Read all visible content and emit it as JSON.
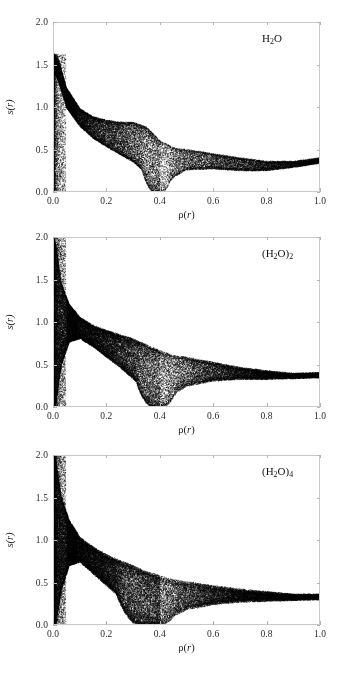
{
  "figure": {
    "width": 344,
    "height": 680,
    "background": "#ffffff",
    "axis_color": "#c9c9c9",
    "point_color": "#000000"
  },
  "axes": {
    "x_title_prefix": "ρ(",
    "x_title_var": "r",
    "x_title_suffix": ")",
    "y_title_prefix": "s(",
    "y_title_var": "r",
    "y_title_suffix": ")",
    "x_ticks": [
      0.0,
      0.2,
      0.4,
      0.6,
      0.8,
      1.0
    ],
    "x_tick_labels": [
      "0.0",
      "0.2",
      "0.4",
      "0.6",
      "0.8",
      "1.0"
    ],
    "y_ticks": [
      0.0,
      0.5,
      1.0,
      1.5,
      2.0
    ],
    "y_tick_labels": [
      "0.0",
      "0.5",
      "1.0",
      "1.5",
      "2.0"
    ],
    "xlim": [
      0.0,
      1.0
    ],
    "ylim": [
      0.0,
      2.0
    ],
    "grid": false
  },
  "chart_data": {
    "type": "scatter",
    "title": "",
    "xlabel": "ρ(r)",
    "ylabel": "s(r)",
    "xlim": [
      0.0,
      1.0
    ],
    "ylim": [
      0.0,
      2.0
    ],
    "x_ticks": [
      0.0,
      0.2,
      0.4,
      0.6,
      0.8,
      1.0
    ],
    "y_ticks": [
      0.0,
      0.5,
      1.0,
      1.5,
      2.0
    ],
    "grid": false,
    "legend": "none",
    "panels": [
      {
        "id": "monomer",
        "label_prefix": "H",
        "label_sub": "2",
        "label_suffix": "O",
        "label_plain": "H2O",
        "n_points": 42000,
        "spread": 0.055,
        "cusp_x": 0.385,
        "cusp_width": 0.055,
        "peak_s": 1.63,
        "peak_x": 0.018,
        "tail_min_s": 0.275,
        "tail_min_x": 0.76,
        "tail_end_s": 0.385,
        "bump_x": 0.3,
        "bump_amp": 0.1,
        "jitter": 0.01,
        "edge_darkness": 0.85,
        "series": {
          "envelope_x": [
            0.0,
            0.02,
            0.05,
            0.1,
            0.15,
            0.2,
            0.25,
            0.3,
            0.35,
            0.4,
            0.45,
            0.5,
            0.6,
            0.7,
            0.8,
            0.9,
            1.0
          ],
          "envelope_top": [
            1.63,
            1.55,
            1.22,
            0.98,
            0.88,
            0.82,
            0.78,
            0.76,
            0.72,
            0.58,
            0.52,
            0.5,
            0.45,
            0.4,
            0.36,
            0.36,
            0.4
          ],
          "envelope_bot": [
            1.45,
            1.3,
            1.0,
            0.78,
            0.64,
            0.54,
            0.45,
            0.36,
            0.22,
            0.0,
            0.18,
            0.27,
            0.28,
            0.26,
            0.26,
            0.3,
            0.35
          ]
        }
      },
      {
        "id": "dimer",
        "label_prefix": "(H",
        "label_sub": "2",
        "label_mid": "O)",
        "label_sub2": "2",
        "label_plain": "(H2O)2",
        "n_points": 62000,
        "spread": 0.085,
        "cusp_x": 0.385,
        "cusp_width": 0.075,
        "peak_s": 2.0,
        "peak_x": 0.01,
        "tail_min_s": 0.345,
        "tail_min_x": 0.86,
        "tail_end_s": 0.375,
        "bump_x": 0.3,
        "bump_amp": 0.06,
        "jitter": 0.016,
        "edge_darkness": 0.8,
        "series": {
          "envelope_x": [
            0.0,
            0.01,
            0.03,
            0.06,
            0.1,
            0.15,
            0.2,
            0.25,
            0.3,
            0.35,
            0.4,
            0.45,
            0.5,
            0.6,
            0.7,
            0.8,
            0.9,
            1.0
          ],
          "envelope_top": [
            2.0,
            1.9,
            1.45,
            1.2,
            1.05,
            0.95,
            0.88,
            0.82,
            0.76,
            0.7,
            0.64,
            0.6,
            0.58,
            0.52,
            0.46,
            0.42,
            0.39,
            0.4
          ],
          "envelope_bot": [
            0.0,
            0.05,
            0.5,
            0.78,
            0.82,
            0.72,
            0.6,
            0.48,
            0.34,
            0.18,
            0.02,
            0.16,
            0.26,
            0.32,
            0.34,
            0.34,
            0.35,
            0.36
          ]
        }
      },
      {
        "id": "tetramer",
        "label_prefix": "(H",
        "label_sub": "2",
        "label_mid": "O)",
        "label_sub2": "4",
        "label_plain": "(H2O)4",
        "n_points": 72000,
        "spread": 0.11,
        "cusp_x": 0.345,
        "cusp_width": 0.11,
        "peak_s": 2.0,
        "peak_x": 0.012,
        "tail_min_s": 0.325,
        "tail_min_x": 0.9,
        "tail_end_s": 0.34,
        "bump_x": 0.28,
        "bump_amp": 0.05,
        "jitter": 0.022,
        "edge_darkness": 0.7,
        "series": {
          "envelope_x": [
            0.0,
            0.01,
            0.03,
            0.06,
            0.1,
            0.15,
            0.2,
            0.25,
            0.3,
            0.35,
            0.4,
            0.45,
            0.5,
            0.6,
            0.7,
            0.8,
            0.9,
            1.0
          ],
          "envelope_top": [
            2.0,
            1.92,
            1.5,
            1.22,
            1.02,
            0.9,
            0.8,
            0.72,
            0.66,
            0.6,
            0.56,
            0.52,
            0.5,
            0.45,
            0.41,
            0.38,
            0.35,
            0.35
          ],
          "envelope_bot": [
            0.0,
            0.02,
            0.42,
            0.72,
            0.76,
            0.62,
            0.48,
            0.34,
            0.18,
            0.06,
            0.02,
            0.12,
            0.2,
            0.26,
            0.29,
            0.3,
            0.31,
            0.32
          ]
        }
      }
    ]
  },
  "layout": {
    "panel_tops": [
      22,
      237,
      455
    ],
    "plot_left": 53,
    "plot_right": 320,
    "plot_height": 170,
    "label_x": 262
  }
}
